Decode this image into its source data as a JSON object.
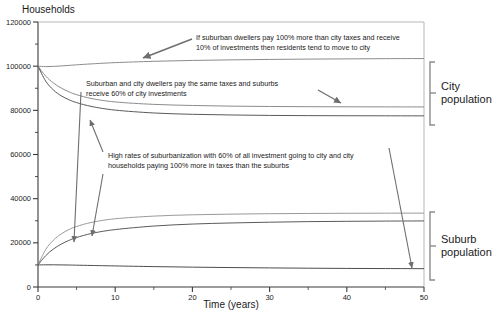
{
  "figure": {
    "y_axis_title": "Households",
    "x_axis_title": "Time (years)"
  },
  "brackets": {
    "city_line1": "City",
    "city_line2": "population",
    "suburb_line1": "Suburb",
    "suburb_line2": "population"
  },
  "annotations": {
    "a1_line1": "If suburban dwellers pay 100% more than city taxes and receive",
    "a1_line2": "10% of investments then residents tend to move to city",
    "a2_line1": "Suburban and city dwellers pay the same taxes and suburbs",
    "a2_line2": "receive 60% of city investments",
    "a3_line1": "High rates of suburbanization with 60% of all investment going to city and city",
    "a3_line2": "households paying 100% more in taxes than the suburbs"
  },
  "chart_data": {
    "type": "line",
    "title": "",
    "xlabel": "Time (years)",
    "ylabel": "Households",
    "xlim": [
      0,
      50
    ],
    "ylim": [
      0,
      120000
    ],
    "xticks": [
      0,
      10,
      20,
      30,
      40,
      50
    ],
    "xtick_labels": [
      "0",
      "10",
      "20",
      "30",
      "40",
      "50"
    ],
    "yticks": [
      0,
      20000,
      40000,
      60000,
      80000,
      100000,
      120000
    ],
    "ytick_labels": [
      "0",
      "20000",
      "40000",
      "60000",
      "80000",
      "100000",
      "120000"
    ],
    "yminor_ticks": [
      10000,
      30000,
      50000,
      70000,
      90000,
      110000
    ],
    "grid": false,
    "legend": "none",
    "x": [
      0,
      1,
      2,
      3,
      4,
      5,
      7,
      10,
      15,
      20,
      25,
      30,
      35,
      40,
      45,
      50
    ],
    "series": [
      {
        "name": "City population - low taxes on city / high suburb taxes",
        "group": "city",
        "color": "#8c8c8c",
        "values": [
          100000,
          99800,
          99900,
          100100,
          100350,
          100600,
          101050,
          101600,
          102200,
          102600,
          102850,
          103050,
          103200,
          103300,
          103400,
          103450
        ]
      },
      {
        "name": "City population - equal taxes, suburbs receive 60% of city investments",
        "group": "city",
        "color": "#8c8c8c",
        "values": [
          100000,
          95500,
          92400,
          90100,
          88400,
          87100,
          85300,
          83800,
          82700,
          82200,
          81900,
          81750,
          81650,
          81600,
          81560,
          81540
        ]
      },
      {
        "name": "City population - high suburbanization, 60% investment to city",
        "group": "city",
        "color": "#5a5a5a",
        "values": [
          100000,
          93200,
          89200,
          86600,
          84800,
          83500,
          81700,
          80100,
          78800,
          78200,
          77900,
          77700,
          77600,
          77550,
          77520,
          77500
        ]
      },
      {
        "name": "Suburb population - equal taxes, suburbs receive 60% of city investments",
        "group": "suburb",
        "color": "#9a9a9a",
        "values": [
          10000,
          17000,
          21200,
          24000,
          26000,
          27400,
          29300,
          30900,
          32100,
          32700,
          33000,
          33200,
          33300,
          33380,
          33430,
          33460
        ]
      },
      {
        "name": "Suburb population - high suburbanization, 60% investment to city",
        "group": "suburb",
        "color": "#5a5a5a",
        "values": [
          10000,
          14200,
          17200,
          19400,
          21100,
          22400,
          24300,
          26000,
          27600,
          28500,
          29000,
          29350,
          29600,
          29750,
          29850,
          29920
        ]
      },
      {
        "name": "Suburb population - high suburb taxes, 10% of investments",
        "group": "suburb",
        "color": "#4d4d4d",
        "values": [
          10000,
          10050,
          10050,
          10000,
          9950,
          9880,
          9740,
          9540,
          9240,
          8990,
          8800,
          8640,
          8520,
          8420,
          8350,
          8300
        ]
      }
    ]
  }
}
